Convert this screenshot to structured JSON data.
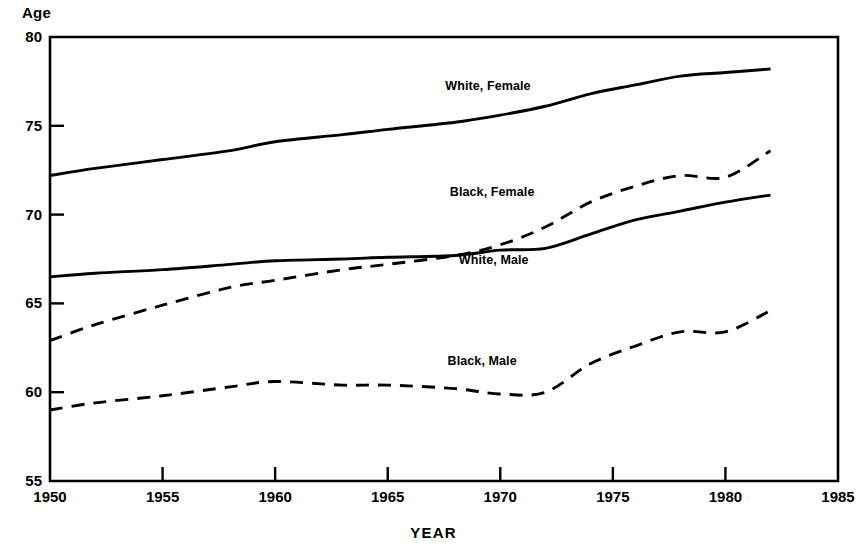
{
  "chart_data": {
    "type": "line",
    "title": "",
    "xlabel": "YEAR",
    "ylabel": "Age",
    "xlim": [
      1950,
      1985
    ],
    "ylim": [
      55,
      80
    ],
    "grid": false,
    "legend_position": "inline-annotations",
    "xticks": [
      1950,
      1955,
      1960,
      1965,
      1970,
      1975,
      1980,
      1985
    ],
    "yticks": [
      55,
      60,
      65,
      70,
      75,
      80
    ],
    "series": [
      {
        "name": "White, Female",
        "style": "solid",
        "color": "#000000",
        "label_x": 1969.6,
        "label_y": 77.2,
        "x": [
          1950,
          1952,
          1955,
          1958,
          1960,
          1963,
          1965,
          1968,
          1970,
          1972,
          1974,
          1976,
          1978,
          1980,
          1982
        ],
        "values": [
          72.2,
          72.6,
          73.1,
          73.6,
          74.1,
          74.5,
          74.8,
          75.2,
          75.6,
          76.1,
          76.8,
          77.3,
          77.8,
          78.0,
          78.2
        ]
      },
      {
        "name": "Black, Female",
        "style": "dashed",
        "color": "#000000",
        "label_x": 1969.8,
        "label_y": 71.2,
        "x": [
          1950,
          1952,
          1955,
          1958,
          1960,
          1963,
          1965,
          1968,
          1970,
          1972,
          1974,
          1976,
          1978,
          1980,
          1982
        ],
        "values": [
          62.9,
          63.8,
          64.9,
          65.9,
          66.3,
          66.9,
          67.2,
          67.7,
          68.3,
          69.3,
          70.7,
          71.6,
          72.2,
          72.1,
          73.6
        ]
      },
      {
        "name": "White, Male",
        "style": "solid",
        "color": "#000000",
        "label_x": 1970.2,
        "label_y": 67.4,
        "x": [
          1950,
          1952,
          1955,
          1958,
          1960,
          1963,
          1965,
          1968,
          1970,
          1972,
          1974,
          1976,
          1978,
          1980,
          1982
        ],
        "values": [
          66.5,
          66.7,
          66.9,
          67.2,
          67.4,
          67.5,
          67.6,
          67.7,
          68.0,
          68.1,
          68.9,
          69.7,
          70.2,
          70.7,
          71.1
        ]
      },
      {
        "name": "Black, Male",
        "style": "dashed",
        "color": "#000000",
        "label_x": 1969.7,
        "label_y": 61.7,
        "x": [
          1950,
          1952,
          1955,
          1958,
          1960,
          1963,
          1965,
          1968,
          1970,
          1972,
          1974,
          1976,
          1978,
          1980,
          1982
        ],
        "values": [
          59.0,
          59.4,
          59.8,
          60.3,
          60.6,
          60.4,
          60.4,
          60.2,
          59.9,
          60.0,
          61.6,
          62.6,
          63.4,
          63.4,
          64.6
        ]
      }
    ]
  },
  "axes": {
    "y_title": "Age",
    "x_title": "YEAR",
    "y_tick_labels": [
      "80",
      "75",
      "70",
      "65",
      "60",
      "55"
    ],
    "x_tick_labels": [
      "1950",
      "1955",
      "1960",
      "1965",
      "1970",
      "1975",
      "1980",
      "1985"
    ]
  },
  "annotations": {
    "white_female": "White, Female",
    "black_female": "Black, Female",
    "white_male": "White, Male",
    "black_male": "Black, Male"
  }
}
